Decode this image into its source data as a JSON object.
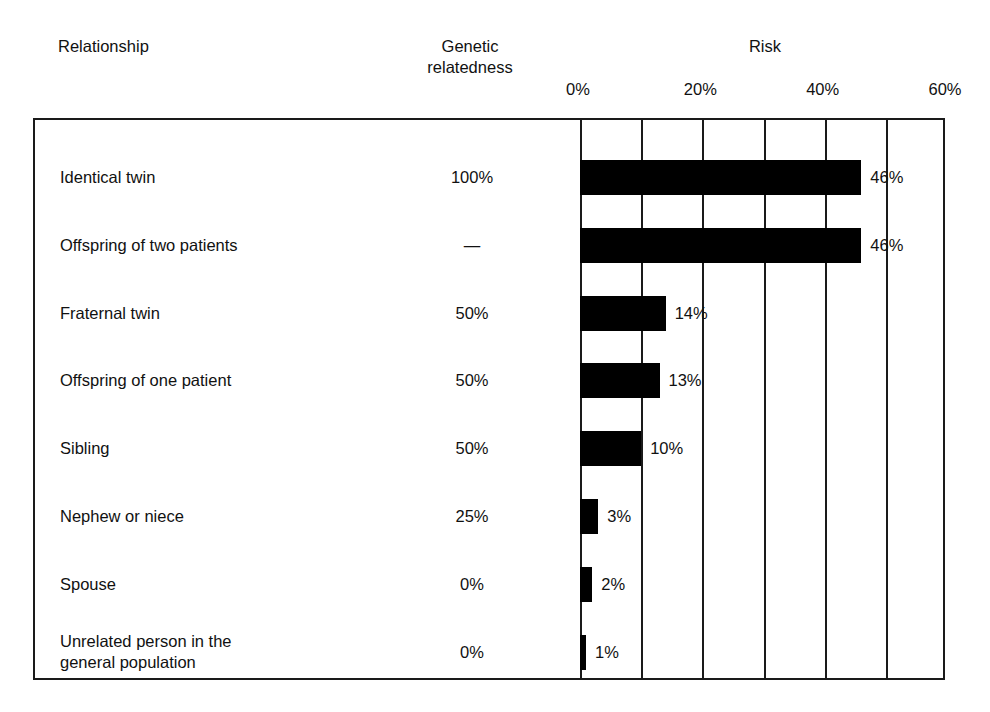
{
  "headers": {
    "relationship": "Relationship",
    "genetic_line1": "Genetic",
    "genetic_line2": "relatedness",
    "risk": "Risk"
  },
  "axis": {
    "ticks": [
      "0%",
      "20%",
      "40%",
      "60%"
    ],
    "tick_values": [
      0,
      20,
      40,
      60
    ],
    "min": 0,
    "max": 60,
    "gridline_step": 10
  },
  "rows": [
    {
      "label_line1": "Identical twin",
      "label_line2": "",
      "relatedness": "100%",
      "risk_label": "46%",
      "risk_value": 46
    },
    {
      "label_line1": "Offspring of two patients",
      "label_line2": "",
      "relatedness": "—",
      "risk_label": "46%",
      "risk_value": 46
    },
    {
      "label_line1": "Fraternal twin",
      "label_line2": "",
      "relatedness": "50%",
      "risk_label": "14%",
      "risk_value": 14
    },
    {
      "label_line1": "Offspring of one patient",
      "label_line2": "",
      "relatedness": "50%",
      "risk_label": "13%",
      "risk_value": 13
    },
    {
      "label_line1": "Sibling",
      "label_line2": "",
      "relatedness": "50%",
      "risk_label": "10%",
      "risk_value": 10
    },
    {
      "label_line1": "Nephew or niece",
      "label_line2": "",
      "relatedness": "25%",
      "risk_label": "3%",
      "risk_value": 3
    },
    {
      "label_line1": "Spouse",
      "label_line2": "",
      "relatedness": "0%",
      "risk_label": "2%",
      "risk_value": 2
    },
    {
      "label_line1": "Unrelated person in the",
      "label_line2": "general population",
      "relatedness": "0%",
      "risk_label": "1%",
      "risk_value": 1
    }
  ],
  "colors": {
    "bar": "#000000",
    "frame": "#1a1a1a",
    "text": "#111111",
    "background": "#ffffff"
  },
  "chart_data": {
    "type": "bar",
    "orientation": "horizontal",
    "title": "Risk",
    "xlabel": "Risk",
    "ylabel": "Relationship",
    "xlim": [
      0,
      60
    ],
    "xticks": [
      0,
      20,
      40,
      60
    ],
    "xticklabels": [
      "0%",
      "20%",
      "40%",
      "60%"
    ],
    "grid": true,
    "gridline_step": 10,
    "legend": false,
    "categories": [
      "Identical twin",
      "Offspring of two patients",
      "Fraternal twin",
      "Offspring of one patient",
      "Sibling",
      "Nephew or niece",
      "Spouse",
      "Unrelated person in the general population"
    ],
    "values": [
      46,
      46,
      14,
      13,
      10,
      3,
      2,
      1
    ],
    "data_labels": [
      "46%",
      "46%",
      "14%",
      "13%",
      "10%",
      "3%",
      "2%",
      "1%"
    ],
    "extra_columns": [
      {
        "name": "Genetic relatedness",
        "values": [
          "100%",
          "—",
          "50%",
          "50%",
          "50%",
          "25%",
          "0%",
          "0%"
        ]
      }
    ],
    "bar_color": "#000000"
  }
}
